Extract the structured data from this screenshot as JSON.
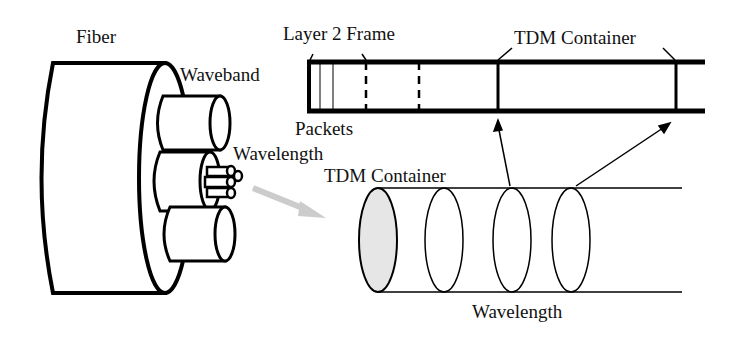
{
  "diagram": {
    "labels": {
      "fiber": "Fiber",
      "waveband": "Waveband",
      "wavelength_top": "Wavelength",
      "layer2_frame": "Layer 2 Frame",
      "tdm_container_top": "TDM Container",
      "packets": "Packets",
      "tdm_container_mid": "TDM Container",
      "wavelength_bottom": "Wavelength"
    },
    "colors": {
      "stroke": "#000000",
      "arrow_gray": "#cccccc",
      "ellipse_fill": "#e6e6e6"
    }
  }
}
